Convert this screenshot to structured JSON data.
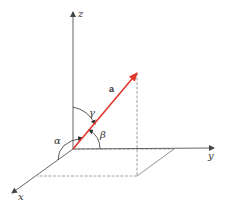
{
  "diagram": {
    "axes": {
      "z": {
        "label": "z",
        "from": [
          73,
          149
        ],
        "to": [
          73,
          12
        ]
      },
      "y": {
        "label": "y",
        "from": [
          73,
          149
        ],
        "to": [
          214,
          148
        ]
      },
      "x": {
        "label": "x",
        "from": [
          73,
          149
        ],
        "to": [
          12,
          193
        ]
      }
    },
    "vector": {
      "label": "a",
      "from": [
        73,
        149
      ],
      "to": [
        137,
        73
      ],
      "color": "#e0382a"
    },
    "angles": {
      "alpha": {
        "label": "α",
        "between": [
          "x",
          "a"
        ]
      },
      "beta": {
        "label": "β",
        "between": [
          "y",
          "a"
        ]
      },
      "gamma": {
        "label": "γ",
        "between": [
          "z",
          "a"
        ]
      }
    },
    "projection": {
      "dashed_vertical": {
        "from": [
          137,
          73
        ],
        "to": [
          137,
          176
        ]
      },
      "parallelogram": [
        [
          73,
          149
        ],
        [
          174,
          149
        ],
        [
          137,
          176
        ],
        [
          37,
          176
        ]
      ]
    },
    "colors": {
      "axis": "#555555",
      "vector": "#e0382a",
      "dashed": "#777777"
    }
  }
}
